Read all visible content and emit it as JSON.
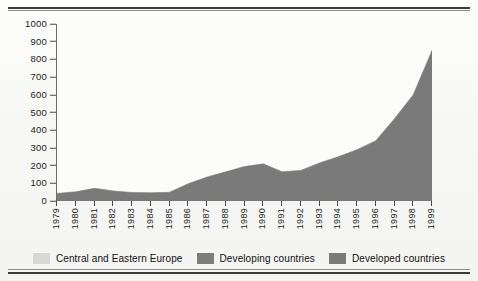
{
  "chart_data": {
    "type": "area",
    "title": "",
    "subtitle": "",
    "xlabel": "",
    "ylabel": "",
    "stacked": true,
    "grid": false,
    "legend_position": "bottom",
    "ylim": [
      0,
      1000
    ],
    "yticks": [
      0,
      100,
      200,
      300,
      400,
      500,
      600,
      700,
      800,
      900,
      1000
    ],
    "ytick_labels": [
      "0",
      "100",
      "200",
      "300",
      "400",
      "500",
      "600",
      "700",
      "800",
      "900",
      "1000"
    ],
    "categories": [
      "1979",
      "1980",
      "1981",
      "1982",
      "1983",
      "1984",
      "1985",
      "1986",
      "1987",
      "1988",
      "1989",
      "1990",
      "1991",
      "1992",
      "1993",
      "1994",
      "1995",
      "1996",
      "1997",
      "1998",
      "1999"
    ],
    "series": [
      {
        "name": "Central and Eastern Europe",
        "color": "#d8d8d6",
        "values": [
          0,
          0,
          0,
          0,
          0,
          0,
          0,
          0,
          0,
          0,
          0,
          0,
          0,
          0,
          0,
          0,
          0,
          0,
          0,
          0,
          0
        ]
      },
      {
        "name": "Developing countries",
        "color": "#7d7d7d",
        "values": [
          0,
          0,
          0,
          0,
          0,
          0,
          0,
          0,
          0,
          0,
          0,
          0,
          0,
          0,
          0,
          0,
          0,
          0,
          0,
          0,
          0
        ]
      },
      {
        "name": "Developed countries",
        "color": "#7a7a7a",
        "values": [
          43,
          52,
          72,
          57,
          48,
          47,
          49,
          98,
          135,
          165,
          195,
          210,
          165,
          173,
          215,
          250,
          290,
          340,
          465,
          600,
          850
        ]
      }
    ]
  },
  "legend": {
    "items": [
      {
        "label": "Central and Eastern Europe",
        "color": "#d8d8d6"
      },
      {
        "label": "Developing countries",
        "color": "#7d7d7d"
      },
      {
        "label": "Developed countries",
        "color": "#7a7a7a"
      }
    ]
  },
  "colors": {
    "area_fill": "#7a7a7a",
    "axis": "#2f2f2f",
    "text": "#1d1d1d",
    "paper": "#fbfbfa",
    "rule": "#3a3a3a"
  }
}
